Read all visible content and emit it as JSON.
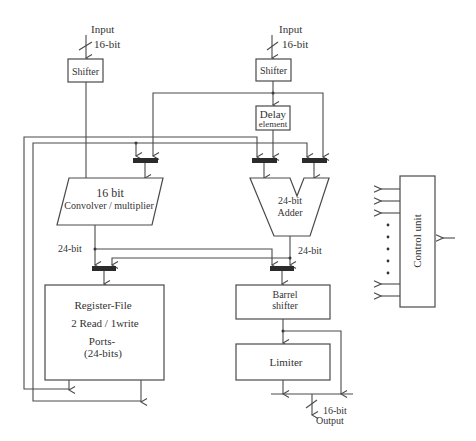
{
  "diagram": {
    "inputs": [
      {
        "label": "Input",
        "width": "16-bit"
      },
      {
        "label": "Input",
        "width": "16-bit"
      }
    ],
    "blocks": {
      "shifter_left": "Shifter",
      "shifter_right": "Shifter",
      "delay": {
        "line1": "Delay",
        "line2": "element"
      },
      "convolver": {
        "line1": "16 bit",
        "line2": "Convolver / multiplier"
      },
      "adder": {
        "line1": "24-bit",
        "line2": "Adder"
      },
      "register_file": {
        "line1": "Register-File",
        "line2": "2 Read / 1write",
        "line3": "Ports-",
        "line4": "(24-bits)"
      },
      "barrel_shifter": {
        "line1": "Barrel",
        "line2": "shifter"
      },
      "limiter": "Limiter",
      "control_unit": "Control unit"
    },
    "bus_labels": {
      "convolver_out": "24-bit",
      "adder_out": "24-bit"
    },
    "output": {
      "width": "16-bit",
      "label": "Output"
    }
  }
}
